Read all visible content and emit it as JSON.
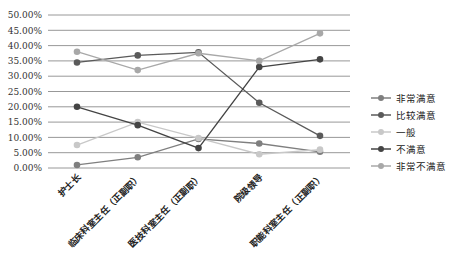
{
  "chart_data": {
    "type": "line",
    "title": "",
    "xlabel": "",
    "ylabel": "",
    "ylim": [
      0,
      50
    ],
    "y_ticks": [
      "0.00%",
      "5.00%",
      "10.00%",
      "15.00%",
      "20.00%",
      "25.00%",
      "30.00%",
      "35.00%",
      "40.00%",
      "45.00%",
      "50.00%"
    ],
    "grid": true,
    "legend_position": "right",
    "categories": [
      "护士长",
      "临床科室主任（正副职）",
      "医技科室主任（正副职）",
      "院级领导",
      "职能科室主任（正副职）"
    ],
    "series": [
      {
        "name": "非常满意",
        "color": "#7f7f7f",
        "values": [
          1.0,
          3.5,
          9.5,
          8.0,
          5.3
        ]
      },
      {
        "name": "比较满意",
        "color": "#5a5a5a",
        "values": [
          34.5,
          36.8,
          37.8,
          21.3,
          10.5
        ]
      },
      {
        "name": "一般",
        "color": "#c8c8c8",
        "values": [
          7.5,
          15.0,
          9.8,
          4.5,
          6.0
        ]
      },
      {
        "name": "不满意",
        "color": "#444444",
        "values": [
          20.0,
          14.0,
          6.5,
          33.0,
          35.5
        ]
      },
      {
        "name": "非常不满意",
        "color": "#a8a8a8",
        "values": [
          38.0,
          32.0,
          37.5,
          35.0,
          44.0
        ]
      }
    ]
  }
}
